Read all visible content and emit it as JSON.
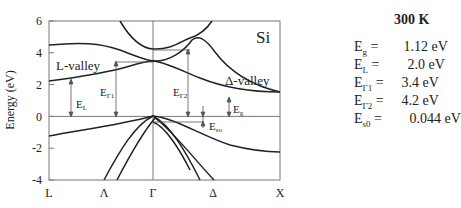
{
  "diagram": {
    "material_label": "Si",
    "y_axis_label": "Energy (eV)",
    "y_ticks": [
      "6",
      "4",
      "2",
      "0",
      "-2",
      "-4"
    ],
    "x_ticks": [
      "L",
      "Λ",
      "Γ",
      "Δ",
      "X"
    ],
    "annotations": {
      "l_valley": "L-valley",
      "delta_valley": "Δ-valley",
      "E_L": "E",
      "E_L_sub": "L",
      "E_G1": "E",
      "E_G1_sub": "Γ1",
      "E_G2": "E",
      "E_G2_sub": "Γ2",
      "E_g": "E",
      "E_g_sub": "g",
      "E_so": "E",
      "E_so_sub": "so"
    }
  },
  "side_panel": {
    "temperature": "300 K",
    "params": [
      {
        "sym": "E",
        "sub": "g",
        "eq": " =",
        "value": "1.12 eV"
      },
      {
        "sym": "E",
        "sub": "L",
        "eq": " =",
        "value": "2.0  eV"
      },
      {
        "sym": "E",
        "sub": "Γ1",
        "eq": " =",
        "value": "3.4  eV"
      },
      {
        "sym": "E",
        "sub": "Γ2",
        "eq": " =",
        "value": "4.2  eV"
      },
      {
        "sym": "E",
        "sub": "s0",
        "eq": " =",
        "value": "0.044 eV"
      }
    ]
  }
}
